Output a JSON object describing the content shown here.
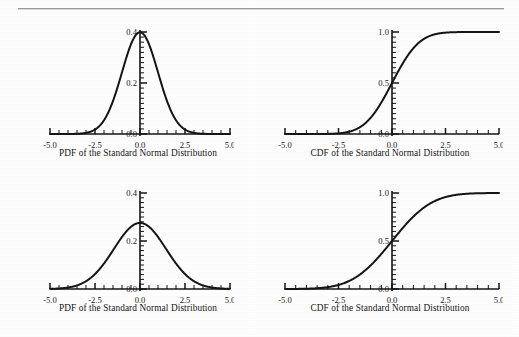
{
  "page": {
    "rule_color": "#9b9b9b",
    "background": "#fefefe",
    "ink_color": "#151515"
  },
  "figures": [
    {
      "id": "top-left-pdf",
      "caption": "PDF of the Standard Normal Distribution",
      "chart_index": 0
    },
    {
      "id": "top-right-cdf",
      "caption": "CDF of the Standard Normal Distribution",
      "chart_index": 1
    },
    {
      "id": "bottom-left-pdf",
      "caption": "PDF of the Standard Normal Distribution",
      "chart_index": 2
    },
    {
      "id": "bottom-right-cdf",
      "caption": "CDF of the Standard Normal Distribution",
      "chart_index": 3
    }
  ],
  "chart_data": [
    {
      "type": "line",
      "id": "top-left-pdf",
      "title": "PDF of the Standard Normal Distribution",
      "xlabel": "PDF of the Standard Normal Distribution",
      "ylabel": "",
      "xlim": [
        -5.0,
        5.0
      ],
      "ylim": [
        0.0,
        0.4
      ],
      "xticks": [
        -5.0,
        -2.5,
        0.0,
        2.5,
        5.0
      ],
      "xticklabels": [
        "-5.0",
        "-2.5",
        "0.0",
        "2.5",
        "5.0"
      ],
      "yticks": [
        0.0,
        0.2,
        0.4
      ],
      "yticklabels": [
        "0.0",
        "0.2",
        "0.4"
      ],
      "minor_xticks_per_major": 5,
      "minor_yticks_per_major": 10,
      "grid": false,
      "legend": null,
      "distribution": {
        "family": "normal",
        "mu": 0.0,
        "sigma": 1.0,
        "peak": 0.399
      },
      "x": [
        -5.0,
        -4.5,
        -4.0,
        -3.5,
        -3.0,
        -2.5,
        -2.0,
        -1.5,
        -1.0,
        -0.5,
        0.0,
        0.5,
        1.0,
        1.5,
        2.0,
        2.5,
        3.0,
        3.5,
        4.0,
        4.5,
        5.0
      ],
      "y": [
        0.0,
        0.0,
        0.0,
        0.001,
        0.004,
        0.018,
        0.054,
        0.13,
        0.242,
        0.352,
        0.399,
        0.352,
        0.242,
        0.13,
        0.054,
        0.018,
        0.004,
        0.001,
        0.0,
        0.0,
        0.0
      ]
    },
    {
      "type": "line",
      "id": "top-right-cdf",
      "title": "CDF of the Standard Normal Distribution",
      "xlabel": "CDF of the Standard Normal Distribution",
      "ylabel": "",
      "xlim": [
        -5.0,
        5.0
      ],
      "ylim": [
        0.0,
        1.0
      ],
      "xticks": [
        -5.0,
        -2.5,
        0.0,
        2.5,
        5.0
      ],
      "xticklabels": [
        "-5.0",
        "-2.5",
        "0.0",
        "2.5",
        "5.0"
      ],
      "yticks": [
        0.0,
        0.5,
        1.0
      ],
      "yticklabels": [
        "0.0",
        "0.5",
        "1.0"
      ],
      "minor_xticks_per_major": 5,
      "minor_yticks_per_major": 10,
      "grid": false,
      "legend": null,
      "distribution": {
        "family": "normal-cdf",
        "mu": 0.0,
        "sigma": 1.0
      },
      "x": [
        -5.0,
        -4.5,
        -4.0,
        -3.5,
        -3.0,
        -2.5,
        -2.0,
        -1.5,
        -1.0,
        -0.5,
        0.0,
        0.5,
        1.0,
        1.5,
        2.0,
        2.5,
        3.0,
        3.5,
        4.0,
        4.5,
        5.0
      ],
      "y": [
        0.0,
        0.0,
        0.0,
        0.0,
        0.001,
        0.006,
        0.023,
        0.067,
        0.159,
        0.309,
        0.5,
        0.691,
        0.841,
        0.933,
        0.977,
        0.994,
        0.999,
        1.0,
        1.0,
        1.0,
        1.0
      ]
    },
    {
      "type": "line",
      "id": "bottom-left-pdf",
      "title": "PDF of the Standard Normal Distribution",
      "xlabel": "PDF of the Standard Normal Distribution",
      "ylabel": "",
      "xlim": [
        -5.0,
        5.0
      ],
      "ylim": [
        0.0,
        0.4
      ],
      "xticks": [
        -5.0,
        -2.5,
        0.0,
        2.5,
        5.0
      ],
      "xticklabels": [
        "-5.0",
        "-2.5",
        "0.0",
        "2.5",
        "5.0"
      ],
      "yticks": [
        0.0,
        0.2,
        0.4
      ],
      "yticklabels": [
        "0.0",
        "0.2",
        "0.4"
      ],
      "minor_xticks_per_major": 5,
      "minor_yticks_per_major": 10,
      "grid": false,
      "legend": null,
      "distribution": {
        "family": "normal",
        "mu": 0.0,
        "sigma": 1.45,
        "peak": 0.275
      },
      "x": [
        -5.0,
        -4.5,
        -4.0,
        -3.5,
        -3.0,
        -2.5,
        -2.0,
        -1.5,
        -1.0,
        -0.5,
        0.0,
        0.5,
        1.0,
        1.5,
        2.0,
        2.5,
        3.0,
        3.5,
        4.0,
        4.5,
        5.0
      ],
      "y": [
        0.001,
        0.005,
        0.015,
        0.035,
        0.072,
        0.125,
        0.183,
        0.234,
        0.263,
        0.259,
        0.275,
        0.259,
        0.263,
        0.234,
        0.183,
        0.125,
        0.072,
        0.035,
        0.015,
        0.005,
        0.001
      ]
    },
    {
      "type": "line",
      "id": "bottom-right-cdf",
      "title": "CDF of the Standard Normal Distribution",
      "xlabel": "CDF of the Standard Normal Distribution",
      "ylabel": "",
      "xlim": [
        -5.0,
        5.0
      ],
      "ylim": [
        0.0,
        1.0
      ],
      "xticks": [
        -5.0,
        -2.5,
        0.0,
        2.5,
        5.0
      ],
      "xticklabels": [
        "-5.0",
        "-2.5",
        "0.0",
        "2.5",
        "5.0"
      ],
      "yticks": [
        0.0,
        0.5,
        1.0
      ],
      "yticklabels": [
        "0.0",
        "0.5",
        "1.0"
      ],
      "minor_xticks_per_major": 5,
      "minor_yticks_per_major": 10,
      "grid": false,
      "legend": null,
      "distribution": {
        "family": "normal-cdf",
        "mu": 0.0,
        "sigma": 1.45
      },
      "x": [
        -5.0,
        -4.5,
        -4.0,
        -3.5,
        -3.0,
        -2.5,
        -2.0,
        -1.5,
        -1.0,
        -0.5,
        0.0,
        0.5,
        1.0,
        1.5,
        2.0,
        2.5,
        3.0,
        3.5,
        4.0,
        4.5,
        5.0
      ],
      "y": [
        0.0,
        0.001,
        0.003,
        0.008,
        0.019,
        0.042,
        0.084,
        0.149,
        0.244,
        0.365,
        0.5,
        0.635,
        0.756,
        0.851,
        0.916,
        0.958,
        0.981,
        0.992,
        0.997,
        0.999,
        1.0
      ]
    }
  ]
}
